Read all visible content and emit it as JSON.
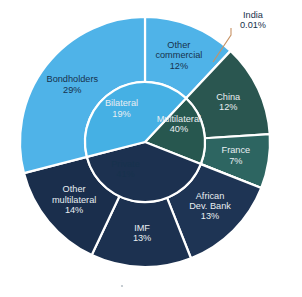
{
  "chart_data": {
    "type": "pie",
    "variant": "two-level-sunburst",
    "title": "",
    "subtitle": "",
    "xlabel": "",
    "ylabel": "",
    "legend_position": "none",
    "grid": false,
    "units": "percent",
    "value_suffix": "%",
    "geometry": {
      "center_x": 145,
      "center_y": 142,
      "outer_radius": 125,
      "inner_ring_radius": 60,
      "start_angle_deg": -90,
      "direction": "clockwise",
      "slice_gap_stroke": "#ffffff"
    },
    "inner_ring": [
      {
        "label": "Private",
        "value": 41,
        "value_text": "41%",
        "color": "#45b0e4",
        "label_color": "light",
        "label_radius": 34,
        "label_angle_deg": 215
      },
      {
        "label": "Bilateral",
        "value": 19,
        "value_text": "19%",
        "color": "#27574f",
        "label_color": "dark",
        "label_radius": 40,
        "label_angle_deg": 324
      },
      {
        "label": "Multilateral",
        "value": 40,
        "value_text": "40%",
        "color": "#1c3150",
        "label_color": "dark",
        "label_radius": 38,
        "label_angle_deg": 63
      }
    ],
    "outer_ring": [
      {
        "label": "Other commercial",
        "value": 12,
        "value_text": "12%",
        "color": "#4fb3e8",
        "label_color": "light",
        "parent": "Private",
        "label_radius": 92,
        "label_lines": [
          "Other",
          "commercial",
          "12%"
        ]
      },
      {
        "label": "China",
        "value": 12,
        "value_text": "12%",
        "color": "#2a5650",
        "label_color": "dark",
        "parent": "Bilateral",
        "label_radius": 92,
        "label_lines": [
          "China",
          "12%"
        ]
      },
      {
        "label": "France",
        "value": 7,
        "value_text": "7%",
        "color": "#2d6561",
        "label_color": "dark",
        "parent": "Bilateral",
        "label_radius": 92,
        "label_lines": [
          "France",
          "7%"
        ]
      },
      {
        "label": "India",
        "value": 0.01,
        "value_text": "0.01%",
        "color": "#2d6561",
        "label_color": "dark",
        "parent": "Bilateral",
        "callout": true,
        "label_lines": [
          "India",
          "0.01%"
        ]
      },
      {
        "label": "African Dev. Bank",
        "value": 13,
        "value_text": "13%",
        "color": "#1e3454",
        "label_color": "dark",
        "parent": "Multilateral",
        "label_radius": 92,
        "label_lines": [
          "African",
          "Dev. Bank",
          "13%"
        ]
      },
      {
        "label": "IMF",
        "value": 13,
        "value_text": "13%",
        "color": "#1c3150",
        "label_color": "dark",
        "parent": "Multilateral",
        "label_radius": 92,
        "label_lines": [
          "IMF",
          "13%"
        ]
      },
      {
        "label": "Other multilateral",
        "value": 14,
        "value_text": "14%",
        "color": "#1a2e4c",
        "label_color": "dark",
        "parent": "Multilateral",
        "label_radius": 92,
        "label_lines": [
          "Other",
          "multilateral",
          "14%"
        ]
      },
      {
        "label": "Bondholders",
        "value": 29,
        "value_text": "29%",
        "color": "#4fb3e8",
        "label_color": "light",
        "parent": "Private",
        "label_radius": 92,
        "label_lines": [
          "Bondholders",
          "29%"
        ]
      }
    ],
    "callouts": [
      {
        "label": "India",
        "value_text": "0.01%",
        "line_color": "#c79264",
        "text_x": 253,
        "text_y": 16,
        "anchor_x": 213,
        "anchor_y": 62,
        "elbow_x": 231,
        "elbow_y": 35
      }
    ],
    "palette": {
      "private_blue": "#4fb3e8",
      "bilateral_teal": "#2a5650",
      "france_teal": "#2d6561",
      "multilateral_navy": "#1c3150",
      "callout_line": "#c79264",
      "separator": "#ffffff",
      "background": "#ffffff"
    }
  }
}
